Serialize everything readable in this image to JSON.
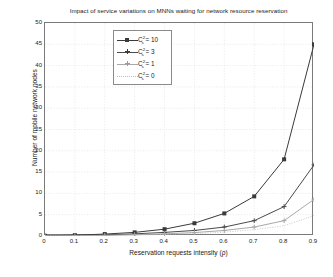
{
  "chart_data": {
    "type": "line",
    "title": "Impact of service variations on MNNs waiting for network resource reservation",
    "xlabel": "Reservation requests intensity (ρ)",
    "ylabel": "Number of mobile network nodes",
    "x": [
      0,
      0.1,
      0.2,
      0.3,
      0.4,
      0.5,
      0.6,
      0.7,
      0.8,
      0.9
    ],
    "xticks": [
      "0",
      "0.1",
      "0.2",
      "0.3",
      "0.4",
      "0.5",
      "0.6",
      "0.7",
      "0.8",
      "0.9"
    ],
    "yticks": [
      "0",
      "5",
      "10",
      "15",
      "20",
      "25",
      "30",
      "35",
      "40",
      "45",
      "50"
    ],
    "xlim": [
      0,
      0.9
    ],
    "ylim": [
      0,
      50
    ],
    "grid": true,
    "legend_position": "upper center",
    "series": [
      {
        "name": "C_s^2 = 10",
        "legend_base": "C",
        "legend_sup": "2",
        "legend_sub": "s",
        "legend_value": " = 10",
        "marker": "square",
        "linestyle": "solid",
        "color": "#3a3a3a",
        "values": [
          0.05,
          0.2,
          0.45,
          0.85,
          1.6,
          3.0,
          5.3,
          9.3,
          18.0,
          45.0
        ]
      },
      {
        "name": "C_s^2 = 3",
        "legend_base": "C",
        "legend_sup": "2",
        "legend_sub": "s",
        "legend_value": " = 3",
        "marker": "plus",
        "linestyle": "solid",
        "color": "#4a4a4a",
        "values": [
          0.03,
          0.1,
          0.25,
          0.5,
          0.85,
          1.3,
          2.1,
          3.6,
          6.9,
          16.7
        ]
      },
      {
        "name": "C_s^2 = 1",
        "legend_base": "C",
        "legend_sup": "2",
        "legend_sub": "s",
        "legend_value": " = 1",
        "marker": "star",
        "linestyle": "solid",
        "color": "#a8a8a8",
        "values": [
          0.02,
          0.06,
          0.15,
          0.3,
          0.5,
          0.8,
          1.3,
          2.1,
          3.6,
          8.6
        ]
      },
      {
        "name": "C_s^2 = 0",
        "legend_base": "C",
        "legend_sup": "2",
        "legend_sub": "s",
        "legend_value": " = 0",
        "marker": "none",
        "linestyle": "dotted",
        "color": "#bdbdbd",
        "values": [
          0.01,
          0.04,
          0.1,
          0.2,
          0.35,
          0.55,
          0.9,
          1.5,
          2.4,
          4.8
        ]
      }
    ]
  }
}
